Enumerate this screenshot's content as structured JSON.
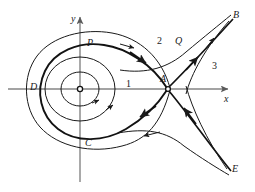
{
  "figure": {
    "type": "phase-portrait",
    "background_color": "#ffffff",
    "curve_color": "#1a1a1a",
    "axis_color": "#808080",
    "width": 255,
    "height": 192
  },
  "axes": {
    "x_label": "x",
    "y_label": "y",
    "origin": {
      "x": 80,
      "y": 89
    },
    "x_axis": {
      "x1": 8,
      "y1": 89,
      "x2": 232,
      "y2": 89
    },
    "y_axis": {
      "x1": 80,
      "y1": 182,
      "x2": 80,
      "y2": 13
    }
  },
  "points": [
    {
      "id": "center",
      "label": "",
      "x": 80,
      "y": 89,
      "marker": "open-circle",
      "role": "center-equilibrium"
    },
    {
      "id": "A",
      "label": "A",
      "x": 168,
      "y": 89,
      "marker": "open-circle",
      "role": "saddle-point",
      "label_x": 161,
      "label_y": 76
    },
    {
      "id": "P",
      "label": "P",
      "x": 88,
      "y": 49,
      "marker": "none",
      "role": "loop-top-point",
      "label_x": 87,
      "label_y": 40
    },
    {
      "id": "Q",
      "label": "Q",
      "x": 178,
      "y": 45,
      "marker": "none",
      "role": "outer-curve-point",
      "label_x": 175,
      "label_y": 38
    },
    {
      "id": "D",
      "label": "D",
      "x": 40,
      "y": 89,
      "marker": "none",
      "role": "loop-left-point",
      "label_x": 33,
      "label_y": 82
    },
    {
      "id": "C",
      "label": "C",
      "x": 88,
      "y": 140,
      "marker": "none",
      "role": "loop-bottom-point",
      "label_x": 87,
      "label_y": 140
    },
    {
      "id": "B",
      "label": "B",
      "x": 234,
      "y": 18,
      "marker": "none",
      "role": "upper-right-terminus",
      "label_x": 233,
      "label_y": 12
    },
    {
      "id": "E",
      "label": "E",
      "x": 232,
      "y": 172,
      "marker": "none",
      "role": "lower-right-terminus",
      "label_x": 232,
      "label_y": 167
    }
  ],
  "regions": [
    {
      "id": "region-1",
      "label": "1",
      "x": 128,
      "y": 84,
      "description": "inside homoclinic loop"
    },
    {
      "id": "region-2",
      "label": "2",
      "x": 158,
      "y": 41,
      "description": "between loop and outer separatrix, upper"
    },
    {
      "id": "region-3",
      "label": "3",
      "x": 213,
      "y": 66,
      "description": "right of separatrix"
    }
  ],
  "curves": [
    {
      "id": "inner-orbit-1",
      "type": "closed-periodic-orbit",
      "direction": "clockwise"
    },
    {
      "id": "inner-orbit-2",
      "type": "closed-periodic-orbit",
      "direction": "clockwise"
    },
    {
      "id": "homoclinic-loop",
      "type": "separatrix-homoclinic",
      "direction": "clockwise",
      "emphasis": "thick"
    },
    {
      "id": "outer-trajectory",
      "type": "closed-periodic-orbit",
      "direction": "clockwise"
    },
    {
      "id": "unstable-manifold-upper",
      "type": "unstable-manifold",
      "from": "A",
      "to": "B"
    },
    {
      "id": "stable-manifold-lower",
      "type": "stable-manifold",
      "from": "E",
      "to": "A"
    },
    {
      "id": "trajectory-B-right",
      "type": "trajectory",
      "to": "B"
    },
    {
      "id": "trajectory-E-right",
      "type": "trajectory",
      "to": "E"
    },
    {
      "id": "separatrix-right",
      "type": "separatrix",
      "description": "curve bounding region 3"
    }
  ],
  "arrows": [
    {
      "on": "homoclinic-loop-upper",
      "direction": "toward-A"
    },
    {
      "on": "homoclinic-loop-lower",
      "direction": "away-from-A"
    },
    {
      "on": "unstable-manifold-upper",
      "direction": "toward-B"
    },
    {
      "on": "stable-manifold-lower",
      "direction": "toward-A"
    },
    {
      "on": "inner-orbit",
      "direction": "clockwise"
    },
    {
      "on": "outer-trajectory-upper",
      "direction": "toward-A"
    },
    {
      "on": "outer-trajectory-lower",
      "direction": "leftward"
    },
    {
      "on": "trajectory-B-right",
      "direction": "toward-B"
    }
  ]
}
